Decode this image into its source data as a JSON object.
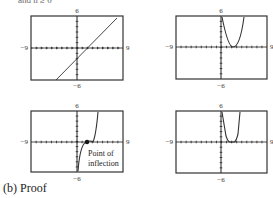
{
  "header_fragment": "and n ≥ 0",
  "window": {
    "xmin": "−9",
    "xmax": "9",
    "ymin": "−6",
    "ymax": "6"
  },
  "annotation": {
    "line1": "Point of",
    "line2": "inflection"
  },
  "caption": "(b)  Proof",
  "chart_data": [
    {
      "type": "line",
      "title": "",
      "xlim": [
        -9,
        9
      ],
      "ylim": [
        -6,
        6
      ],
      "description": "straight line with positive slope",
      "x": [
        -5.5,
        9
      ],
      "y": [
        -6,
        6.5
      ]
    },
    {
      "type": "line",
      "title": "",
      "xlim": [
        -9,
        9
      ],
      "ylim": [
        -6,
        6
      ],
      "description": "parabola-like curve, vertex near x=2.5 touching x-axis",
      "x": [
        0,
        1,
        2,
        2.5,
        3,
        4,
        5.5
      ],
      "y": [
        6,
        2.5,
        0.5,
        0,
        0.5,
        2.5,
        6
      ]
    },
    {
      "type": "line",
      "title": "",
      "xlim": [
        -9,
        9
      ],
      "ylim": [
        -6,
        6
      ],
      "description": "cubic-like curve with point of inflection on x-axis",
      "x": [
        0,
        0.5,
        1,
        2,
        3,
        4,
        5.5
      ],
      "y": [
        -6,
        -3,
        -1.2,
        0,
        0.8,
        2.5,
        6
      ],
      "annotations": [
        "Point of inflection"
      ]
    },
    {
      "type": "line",
      "title": "",
      "xlim": [
        -9,
        9
      ],
      "ylim": [
        -6,
        6
      ],
      "description": "quartic-like curve with minimum region near x-axis",
      "x": [
        0.3,
        1,
        1.6,
        3,
        4.3,
        5
      ],
      "y": [
        6,
        2.5,
        0,
        0,
        2.5,
        6
      ]
    }
  ]
}
